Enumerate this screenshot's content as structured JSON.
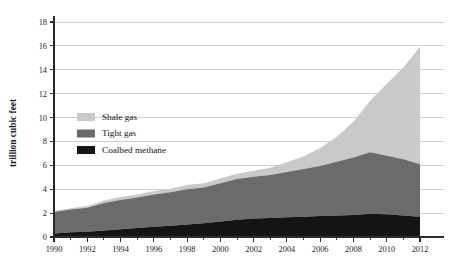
{
  "chart_data": {
    "type": "area",
    "stacked": true,
    "title": "",
    "subtitle": "",
    "xlabel": "",
    "ylabel": "trillion cubic feet",
    "xlim": [
      1990,
      2012
    ],
    "ylim": [
      0,
      18
    ],
    "grid": "horizontal",
    "legend_position": "inside-left",
    "x": [
      1990,
      1991,
      1992,
      1993,
      1994,
      1995,
      1996,
      1997,
      1998,
      1999,
      2000,
      2001,
      2002,
      2003,
      2004,
      2005,
      2006,
      2007,
      2008,
      2009,
      2010,
      2011,
      2012
    ],
    "xticks": [
      1990,
      1992,
      1994,
      1996,
      1998,
      2000,
      2002,
      2004,
      2006,
      2008,
      2010,
      2012
    ],
    "xtick_labels": [
      "1990",
      "1992",
      "1994",
      "1996",
      "1998",
      "2000",
      "2002",
      "2004",
      "2006",
      "2008",
      "2010",
      "2012"
    ],
    "yticks": [
      0,
      2,
      4,
      6,
      8,
      10,
      12,
      14,
      16,
      18
    ],
    "ytick_labels": [
      "0",
      "2",
      "4",
      "6",
      "8",
      "10",
      "12",
      "14",
      "16",
      "18"
    ],
    "series": [
      {
        "name": "Coalbed methane",
        "color": "#141414",
        "values": [
          0.3,
          0.4,
          0.45,
          0.55,
          0.65,
          0.75,
          0.85,
          0.95,
          1.05,
          1.15,
          1.3,
          1.45,
          1.55,
          1.6,
          1.65,
          1.7,
          1.75,
          1.8,
          1.85,
          1.95,
          1.9,
          1.8,
          1.7
        ]
      },
      {
        "name": "Tight gas",
        "color": "#6b6b6b",
        "values": [
          1.8,
          1.9,
          2.0,
          2.3,
          2.45,
          2.55,
          2.7,
          2.8,
          2.95,
          3.0,
          3.2,
          3.4,
          3.5,
          3.6,
          3.8,
          4.0,
          4.2,
          4.5,
          4.8,
          5.15,
          4.9,
          4.7,
          4.4
        ]
      },
      {
        "name": "Shale gas",
        "color": "#c9c9c9",
        "values": [
          0.1,
          0.1,
          0.15,
          0.2,
          0.25,
          0.25,
          0.3,
          0.3,
          0.35,
          0.35,
          0.4,
          0.45,
          0.5,
          0.6,
          0.8,
          1.05,
          1.5,
          2.1,
          3.0,
          4.3,
          6.0,
          7.7,
          9.8
        ]
      }
    ],
    "totals": [
      2.2,
      2.4,
      2.6,
      3.05,
      3.35,
      3.55,
      3.85,
      4.05,
      4.35,
      4.5,
      4.9,
      5.3,
      5.55,
      5.8,
      6.25,
      6.75,
      7.45,
      8.4,
      9.65,
      11.4,
      12.8,
      14.2,
      15.9
    ]
  },
  "legend": {
    "items": [
      {
        "label": "Shale gas",
        "color": "#c9c9c9"
      },
      {
        "label": "Tight gas",
        "color": "#6b6b6b"
      },
      {
        "label": "Coalbed methane",
        "color": "#141414"
      }
    ]
  },
  "axis": {
    "y_title": "trillion cubic feet"
  },
  "colors": {
    "shale_gas": "#c9c9c9",
    "tight_gas": "#6b6b6b",
    "coalbed_methane": "#141414",
    "grid": "#b9b9b9",
    "axis": "#2b2b2b",
    "background": "#ffffff"
  }
}
